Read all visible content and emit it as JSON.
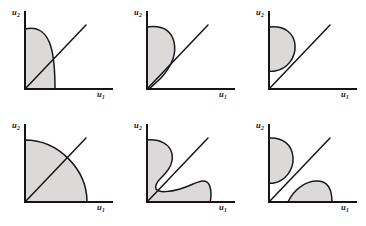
{
  "figure": {
    "background_color": "#ffffff",
    "ink_color": "#16141a",
    "fill_color": "#dcdad8",
    "fill_edge_color": "#1a181c",
    "axis_label_y": "u",
    "axis_label_y_sub": "2",
    "axis_label_x": "u",
    "axis_label_x_sub": "1",
    "panels": [
      {
        "id": "panel-a",
        "name": "convex-set-boundary-meets-horizontal-axis",
        "label_y": "u",
        "label_y_sub": "2",
        "label_x": "u",
        "label_x_sub": "1",
        "has_diagonal": true,
        "region_count": 1,
        "description": "Shaded region bounded by both axes, rising to a flat top at left and falling with a steep convex arc that meets the horizontal axis at a right angle; the 45-degree ray crosses the region's right boundary."
      },
      {
        "id": "panel-b",
        "name": "nonconvex-set-pinching-to-origin",
        "label_y": "u",
        "label_y_sub": "2",
        "label_x": "u",
        "label_x_sub": "1",
        "has_diagonal": true,
        "region_count": 1,
        "description": "Shaded region with a concave right boundary that narrows toward the origin, touching the horizontal axis only near the corner; the 45-degree ray exits through the concave edge."
      },
      {
        "id": "panel-c",
        "name": "lobe-above-diagonal-touching-vertical-axis",
        "label_y": "u",
        "label_y_sub": "2",
        "label_x": "u",
        "label_x_sub": "1",
        "has_diagonal": true,
        "region_count": 1,
        "description": "A single rounded lobe pressed against the vertical axis, lying entirely above and to the left of the 45-degree ray."
      },
      {
        "id": "panel-d",
        "name": "quarter-disc-convex-set",
        "label_y": "u",
        "label_y_sub": "2",
        "label_x": "u",
        "label_x_sub": "1",
        "has_diagonal": true,
        "region_count": 1,
        "description": "A quarter-disc filling the corner, meeting the vertical axis at the top and the horizontal axis at the right; the 45-degree ray passes through the arc."
      },
      {
        "id": "panel-e",
        "name": "nonconvex-s-curved-set-two-lobes-joined",
        "label_y": "u",
        "label_y_sub": "2",
        "label_x": "u",
        "label_x_sub": "1",
        "has_diagonal": true,
        "region_count": 1,
        "description": "A connected non-convex region whose frontier makes an S-curve: an upper lobe against the vertical axis and a lower wavy lobe along the horizontal axis, pinched together near the 45-degree ray."
      },
      {
        "id": "panel-f",
        "name": "disconnected-set-two-separate-lobes",
        "label_y": "u",
        "label_y_sub": "2",
        "label_x": "u",
        "label_x_sub": "1",
        "has_diagonal": true,
        "region_count": 2,
        "description": "Two disjoint shaded lobes separated by the 45-degree ray: one against the vertical axis above the ray, one resting on the horizontal axis below the ray."
      }
    ]
  }
}
